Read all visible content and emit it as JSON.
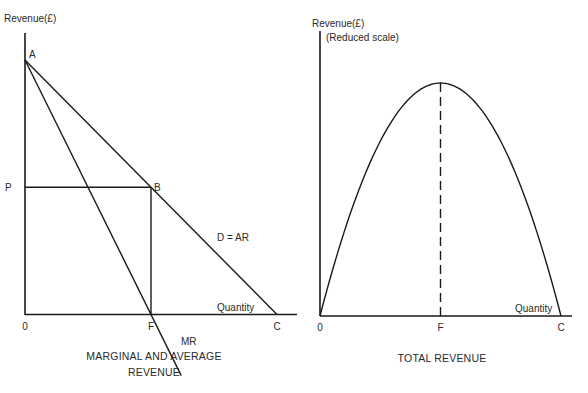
{
  "chart_data": [
    {
      "type": "line",
      "title": "MARGINAL AND AVERAGE REVENUE",
      "caption_lines": [
        "MARGINAL AND AVERAGE",
        "REVENUE"
      ],
      "ylabel": "Revenue(£)",
      "xlabel": "Quantity",
      "grid": false,
      "xlim": [
        0,
        11.5
      ],
      "ylim": [
        -2.6,
        11
      ],
      "series": [
        {
          "name": "D=AR",
          "label": "D = AR",
          "points": [
            [
              0,
              10
            ],
            [
              10,
              0
            ]
          ]
        },
        {
          "name": "MR",
          "label": "MR",
          "points": [
            [
              0,
              10
            ],
            [
              6.2,
              -2.4
            ]
          ]
        }
      ],
      "guides": [
        {
          "name": "price-line",
          "points": [
            [
              0,
              5
            ],
            [
              5,
              5
            ]
          ]
        },
        {
          "name": "quantity-line",
          "points": [
            [
              5,
              5
            ],
            [
              5,
              0
            ]
          ]
        }
      ],
      "point_labels": [
        {
          "name": "A",
          "text": "A",
          "x": 0,
          "y": 10
        },
        {
          "name": "B",
          "text": "B",
          "x": 5,
          "y": 5
        },
        {
          "name": "P",
          "text": "P",
          "x": 0,
          "y": 5
        }
      ],
      "x_tick_labels": [
        {
          "text": "0",
          "x": 0
        },
        {
          "text": "F",
          "x": 5
        },
        {
          "text": "C",
          "x": 10
        }
      ]
    },
    {
      "type": "line",
      "title": "TOTAL REVENUE",
      "caption_lines": [
        "TOTAL REVENUE"
      ],
      "ylabel": "Revenue(£)",
      "ylabel_note": "(Reduced scale)",
      "xlabel": "Quantity",
      "grid": false,
      "xlim": [
        0,
        10.6
      ],
      "ylim": [
        0,
        30.5
      ],
      "series": [
        {
          "name": "TR",
          "label": "",
          "function": "total revenue = 10q - q^2",
          "x": [
            0,
            1,
            2,
            3,
            4,
            5,
            6,
            7,
            8,
            9,
            10
          ],
          "y": [
            0,
            9,
            16,
            21,
            24,
            25,
            24,
            21,
            16,
            9,
            0
          ]
        }
      ],
      "guides": [
        {
          "name": "max-revenue-dashed-line",
          "points": [
            [
              5,
              0
            ],
            [
              5,
              25
            ]
          ]
        }
      ],
      "x_tick_labels": [
        {
          "text": "0",
          "x": 0
        },
        {
          "text": "F",
          "x": 5
        },
        {
          "text": "C",
          "x": 10
        }
      ]
    }
  ]
}
